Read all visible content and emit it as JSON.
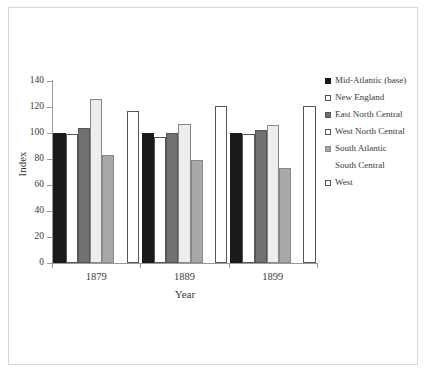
{
  "chart_data": {
    "type": "bar",
    "title": "",
    "subtitle": "",
    "xlabel": "Year",
    "ylabel": "Index",
    "categories": [
      "1879",
      "1889",
      "1899"
    ],
    "ylim": [
      0,
      140
    ],
    "yticks": [
      0,
      20,
      40,
      60,
      80,
      100,
      120,
      140
    ],
    "ytick_labels": [
      "0",
      "20",
      "40",
      "60",
      "80",
      "100",
      "120",
      "140"
    ],
    "grid": false,
    "legend_position": "right",
    "series": [
      {
        "name": "Mid-Atlantic (base)",
        "color": "#1a1a1a",
        "border": "#1a1a1a",
        "values": [
          100,
          100,
          100
        ]
      },
      {
        "name": "New England",
        "color": "#ffffff",
        "border": "#555555",
        "values": [
          99,
          97,
          99
        ]
      },
      {
        "name": "East North Central",
        "color": "#717171",
        "border": "#555555",
        "values": [
          104,
          100,
          102
        ]
      },
      {
        "name": "West North Central",
        "color": "#ededed",
        "border": "#888888",
        "values": [
          126,
          107,
          106
        ]
      },
      {
        "name": "South Atlantic",
        "color": "#a8a8a8",
        "border": "#888888",
        "values": [
          83,
          79,
          73
        ]
      },
      {
        "name": "South Central",
        "color": "#ffffff",
        "border": "#ffffff",
        "values": [
          0,
          0,
          0
        ]
      },
      {
        "name": "West",
        "color": "#ffffff",
        "border": "#555555",
        "values": [
          117,
          121,
          121
        ]
      }
    ],
    "legend_entries": [
      {
        "label": "Mid-Atlantic (base)",
        "swatch": "filled-black",
        "has_swatch": true
      },
      {
        "label": "New England",
        "swatch": "outline-white",
        "has_swatch": true
      },
      {
        "label": "East North Central",
        "swatch": "filled-dark-gray",
        "has_swatch": true
      },
      {
        "label": "West North Central",
        "swatch": "outline-white",
        "has_swatch": true
      },
      {
        "label": "South Atlantic",
        "swatch": "filled-mid-gray",
        "has_swatch": true
      },
      {
        "label": "South Central",
        "swatch": "none",
        "has_swatch": false
      },
      {
        "label": "West",
        "swatch": "outline-white",
        "has_swatch": true
      }
    ]
  },
  "colors": {
    "frame": "#d6d6d6",
    "axis": "#9a9a9a",
    "text": "#3a3a3a",
    "background": "#ffffff"
  }
}
